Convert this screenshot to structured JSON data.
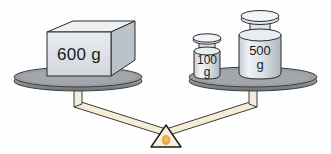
{
  "diagram": {
    "type": "balance-scale",
    "background_color": "#fefefe",
    "balanced": true,
    "fulcrum": {
      "name": "triangular-fulcrum",
      "fill_color": "#f7f0dc",
      "center_dot_color": "#e8a93c",
      "outline_color": "#1a1a1a"
    },
    "beam": {
      "name": "v-beam",
      "fill_color": "#f5edd6",
      "outline_color": "#3a3a3a"
    },
    "left_pan": {
      "name": "left-pan",
      "top_color": "#9a9ea2",
      "rim_color": "#4d5154",
      "total_grams": 600,
      "items": [
        {
          "id": "block-600",
          "shape": "rectangular-block",
          "label_line1": "600 g",
          "value": 600,
          "unit": "g",
          "face_color": "#dfe3e8",
          "top_color": "#eef1f4",
          "side_color": "#b9bfc6",
          "outline_color": "#2b2b2b"
        }
      ]
    },
    "right_pan": {
      "name": "right-pan",
      "top_color": "#9a9ea2",
      "rim_color": "#4d5154",
      "total_grams": 600,
      "items": [
        {
          "id": "weight-100",
          "shape": "cylindrical-weight",
          "label_line1": "100",
          "label_line2": "g",
          "value": 100,
          "unit": "g",
          "body_color": "#dde2e7",
          "highlight_color": "#f2f5f8",
          "shadow_color": "#b4bac1",
          "outline_color": "#2b2b2b"
        },
        {
          "id": "weight-500",
          "shape": "cylindrical-weight",
          "label_line1": "500",
          "label_line2": "g",
          "value": 500,
          "unit": "g",
          "body_color": "#dde2e7",
          "highlight_color": "#f2f5f8",
          "shadow_color": "#b4bac1",
          "outline_color": "#2b2b2b"
        }
      ]
    }
  }
}
